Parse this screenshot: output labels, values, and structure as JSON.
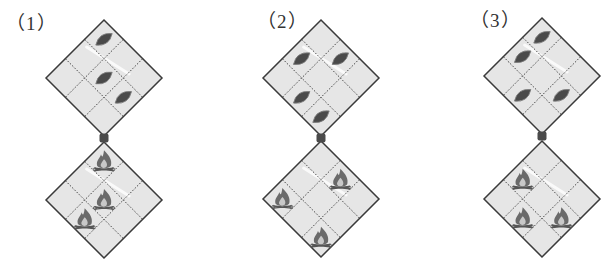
{
  "figure": {
    "width": 610,
    "height": 262,
    "grid_size": 3,
    "half_diagonal": 58,
    "colors": {
      "diamond_fill": "#e6e6e6",
      "diamond_border": "#3a3a3a",
      "grid_line": "#3a3a3a",
      "connector": "#4a4a4a",
      "leaf": "#4a4a4a",
      "leaf_edge": "#7a7a7a",
      "fire_outer": "#6a6a6a",
      "fire_inner": "#c8c8c8",
      "logs": "#555555",
      "label": "#333333"
    }
  },
  "panels": [
    {
      "label": "（1）",
      "label_x": 6,
      "label_y": 9,
      "center_x": 104,
      "top_diamond": {
        "top_y": 20,
        "icon": "leaf",
        "cells": [
          [
            0,
            0
          ],
          [
            1,
            1
          ],
          [
            1,
            2
          ]
        ]
      },
      "connector_y": 138,
      "bottom_diamond": {
        "top_y": 142,
        "icon": "campfire",
        "cells": [
          [
            0,
            0
          ],
          [
            1,
            1
          ],
          [
            2,
            1
          ]
        ]
      }
    },
    {
      "label": "（2）",
      "label_x": 257,
      "label_y": 7,
      "center_x": 321,
      "top_diamond": {
        "top_y": 20,
        "icon": "leaf",
        "cells": [
          [
            1,
            0
          ],
          [
            0,
            1
          ],
          [
            2,
            1
          ],
          [
            2,
            2
          ]
        ]
      },
      "connector_y": 138,
      "bottom_diamond": {
        "top_y": 141,
        "icon": "campfire",
        "cells": [
          [
            0,
            1
          ],
          [
            2,
            0
          ],
          [
            2,
            2
          ]
        ]
      }
    },
    {
      "label": "（3）",
      "label_x": 470,
      "label_y": 6,
      "center_x": 542,
      "top_diamond": {
        "top_y": 18,
        "icon": "leaf",
        "cells": [
          [
            0,
            0
          ],
          [
            1,
            0
          ],
          [
            2,
            1
          ],
          [
            1,
            2
          ]
        ]
      },
      "connector_y": 136,
      "bottom_diamond": {
        "top_y": 141,
        "icon": "campfire",
        "cells": [
          [
            1,
            0
          ],
          [
            2,
            1
          ],
          [
            1,
            2
          ]
        ]
      }
    }
  ]
}
